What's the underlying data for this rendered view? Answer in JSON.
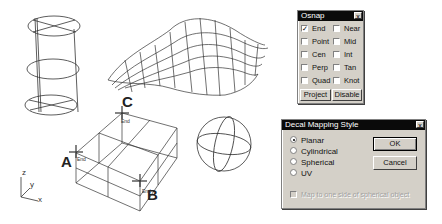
{
  "scene": {
    "objects": [
      "cylinder-wireframe",
      "surface-wireframe",
      "box-wireframe",
      "sphere-wireframe"
    ],
    "point_labels": [
      "A",
      "B",
      "C"
    ],
    "snap_tags": [
      "End",
      "End",
      "End"
    ],
    "axes": {
      "z": "z",
      "y": "y",
      "x": "x"
    }
  },
  "osnap": {
    "title": "Osnap",
    "close": "x",
    "items": [
      {
        "label": "End",
        "checked": true
      },
      {
        "label": "Near",
        "checked": false
      },
      {
        "label": "Point",
        "checked": false
      },
      {
        "label": "Mid",
        "checked": false
      },
      {
        "label": "Cen",
        "checked": false
      },
      {
        "label": "Int",
        "checked": false
      },
      {
        "label": "Perp",
        "checked": false
      },
      {
        "label": "Tan",
        "checked": false
      },
      {
        "label": "Quad",
        "checked": false
      },
      {
        "label": "Knot",
        "checked": false
      }
    ],
    "buttons": {
      "project": "Project",
      "disable": "Disable"
    }
  },
  "decal": {
    "title": "Decal Mapping Style",
    "close": "x",
    "options": [
      {
        "label": "Planar",
        "selected": true
      },
      {
        "label": "Cylindrical",
        "selected": false
      },
      {
        "label": "Spherical",
        "selected": false
      },
      {
        "label": "UV",
        "selected": false
      }
    ],
    "ok": "OK",
    "cancel": "Cancel",
    "checkbox_label": "Map to one side of spherical object"
  }
}
